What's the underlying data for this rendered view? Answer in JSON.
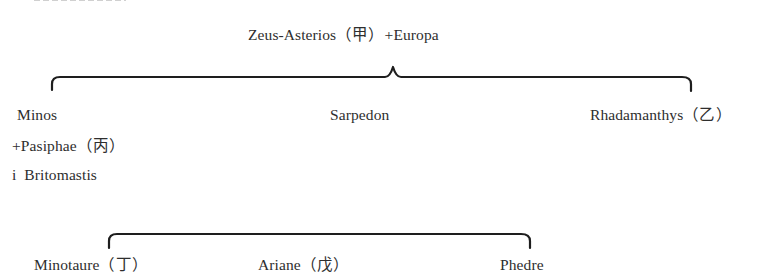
{
  "diagram": {
    "type": "genealogy",
    "root": {
      "label": "Zeus-Asterios（甲）+Europa"
    },
    "children": [
      {
        "label": "Minos"
      },
      {
        "label": "Sarpedon"
      },
      {
        "label": "Rhadamanthys（乙）"
      }
    ],
    "minos_spouses": [
      {
        "label": "+Pasiphae（丙）"
      },
      {
        "label": "i  Britomastis"
      }
    ],
    "grandchildren": [
      {
        "label": "Minotaure（丁）"
      },
      {
        "label": "Ariane（戊）"
      },
      {
        "label": "Phedre"
      }
    ]
  },
  "colors": {
    "text": "#2e2e2e",
    "lines": "#1e1e1e",
    "background": "#ffffff"
  }
}
